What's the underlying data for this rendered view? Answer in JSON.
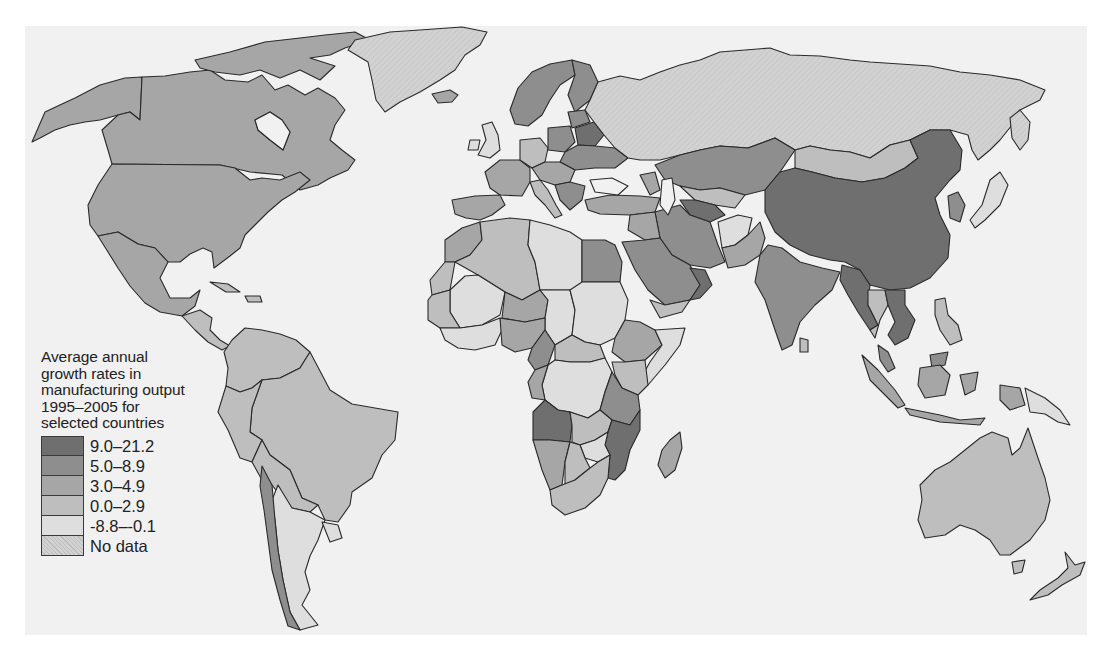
{
  "legend": {
    "title_lines": [
      "Average annual",
      "growth rates in",
      "manufacturing output",
      "1995–2005 for",
      "selected countries"
    ],
    "items": [
      {
        "label": "9.0–21.2",
        "color": "#6f6f6f"
      },
      {
        "label": "5.0–8.9",
        "color": "#8e8e8e"
      },
      {
        "label": "3.0–4.9",
        "color": "#a6a6a6"
      },
      {
        "label": "0.0–2.9",
        "color": "#bebebe"
      },
      {
        "label": "-8.8–-0.1",
        "color": "#dedede"
      },
      {
        "label": "No data",
        "color": "#cdcdcd"
      }
    ]
  },
  "colors": {
    "page_bg": "#ffffff",
    "panel_bg": "#f1f1f1",
    "water": "#f1f1f1",
    "border": "#2a2a2a"
  },
  "map": {
    "type": "choropleth",
    "subject": "Average annual growth rates in manufacturing output 1995–2005",
    "regions": [
      {
        "name": "Canada",
        "class": "3.0–4.9"
      },
      {
        "name": "United States",
        "class": "3.0–4.9"
      },
      {
        "name": "Alaska",
        "class": "3.0–4.9"
      },
      {
        "name": "Greenland",
        "class": "No data"
      },
      {
        "name": "Iceland",
        "class": "3.0–4.9"
      },
      {
        "name": "Mexico",
        "class": "3.0–4.9"
      },
      {
        "name": "Central America",
        "class": "0.0–2.9"
      },
      {
        "name": "Cuba",
        "class": "0.0–2.9"
      },
      {
        "name": "Brazil",
        "class": "0.0–2.9"
      },
      {
        "name": "Argentina",
        "class": "-8.8–-0.1"
      },
      {
        "name": "Chile",
        "class": "5.0–8.9"
      },
      {
        "name": "Peru",
        "class": "0.0–2.9"
      },
      {
        "name": "Colombia",
        "class": "0.0–2.9"
      },
      {
        "name": "Venezuela",
        "class": "0.0–2.9"
      },
      {
        "name": "Bolivia",
        "class": "0.0–2.9"
      },
      {
        "name": "Paraguay",
        "class": "0.0–2.9"
      },
      {
        "name": "Uruguay",
        "class": "-8.8–-0.1"
      },
      {
        "name": "Russia",
        "class": "No data"
      },
      {
        "name": "Kazakhstan",
        "class": "5.0–8.9"
      },
      {
        "name": "Mongolia",
        "class": "0.0–2.9"
      },
      {
        "name": "China",
        "class": "9.0–21.2"
      },
      {
        "name": "India",
        "class": "5.0–8.9"
      },
      {
        "name": "Myanmar",
        "class": "9.0–21.2"
      },
      {
        "name": "Vietnam",
        "class": "9.0–21.2"
      },
      {
        "name": "Thailand",
        "class": "0.0–2.9"
      },
      {
        "name": "Iran",
        "class": "5.0–8.9"
      },
      {
        "name": "Turkmenistan",
        "class": "9.0–21.2"
      },
      {
        "name": "Afghanistan",
        "class": "-8.8–-0.1"
      },
      {
        "name": "Pakistan",
        "class": "3.0–4.9"
      },
      {
        "name": "Saudi Arabia",
        "class": "5.0–8.9"
      },
      {
        "name": "Oman",
        "class": "9.0–21.2"
      },
      {
        "name": "Yemen",
        "class": "0.0–2.9"
      },
      {
        "name": "Turkey",
        "class": "3.0–4.9"
      },
      {
        "name": "Egypt",
        "class": "5.0–8.9"
      },
      {
        "name": "Libya",
        "class": "-8.8–-0.1"
      },
      {
        "name": "Algeria",
        "class": "0.0–2.9"
      },
      {
        "name": "Morocco",
        "class": "3.0–4.9"
      },
      {
        "name": "Sudan",
        "class": "-8.8–-0.1"
      },
      {
        "name": "Ethiopia",
        "class": "3.0–4.9"
      },
      {
        "name": "Somalia",
        "class": "-8.8–-0.1"
      },
      {
        "name": "DR Congo",
        "class": "-8.8–-0.1"
      },
      {
        "name": "Angola",
        "class": "9.0–21.2"
      },
      {
        "name": "Mozambique",
        "class": "9.0–21.2"
      },
      {
        "name": "Tanzania",
        "class": "5.0–8.9"
      },
      {
        "name": "Zambia",
        "class": "0.0–2.9"
      },
      {
        "name": "Zimbabwe",
        "class": "-8.8–-0.1"
      },
      {
        "name": "Namibia",
        "class": "3.0–4.9"
      },
      {
        "name": "Botswana",
        "class": "0.0–2.9"
      },
      {
        "name": "South Africa",
        "class": "0.0–2.9"
      },
      {
        "name": "Madagascar",
        "class": "3.0–4.9"
      },
      {
        "name": "Niger",
        "class": "3.0–4.9"
      },
      {
        "name": "Mali",
        "class": "-8.8–-0.1"
      },
      {
        "name": "Chad",
        "class": "-8.8–-0.1"
      },
      {
        "name": "Nigeria",
        "class": "3.0–4.9"
      },
      {
        "name": "Cameroon",
        "class": "5.0–8.9"
      },
      {
        "name": "Kenya",
        "class": "0.0–2.9"
      },
      {
        "name": "Scandinavia",
        "class": "5.0–8.9"
      },
      {
        "name": "Finland",
        "class": "5.0–8.9"
      },
      {
        "name": "Belarus",
        "class": "9.0–21.2"
      },
      {
        "name": "Ukraine",
        "class": "5.0–8.9"
      },
      {
        "name": "France",
        "class": "3.0–4.9"
      },
      {
        "name": "Spain",
        "class": "3.0–4.9"
      },
      {
        "name": "United Kingdom",
        "class": "-8.8–-0.1"
      },
      {
        "name": "Germany",
        "class": "0.0–2.9"
      },
      {
        "name": "Poland",
        "class": "5.0–8.9"
      },
      {
        "name": "Italy",
        "class": "0.0–2.9"
      },
      {
        "name": "Korea",
        "class": "5.0–8.9"
      },
      {
        "name": "Japan",
        "class": "-8.8–-0.1"
      },
      {
        "name": "Indonesia",
        "class": "3.0–4.9"
      },
      {
        "name": "Malaysia",
        "class": "5.0–8.9"
      },
      {
        "name": "Philippines",
        "class": "0.0–2.9"
      },
      {
        "name": "Papua New Guinea",
        "class": "-8.8–-0.1"
      },
      {
        "name": "Australia",
        "class": "0.0–2.9"
      },
      {
        "name": "New Zealand",
        "class": "0.0–2.9"
      },
      {
        "name": "Sri Lanka",
        "class": "0.0–2.9"
      }
    ]
  }
}
